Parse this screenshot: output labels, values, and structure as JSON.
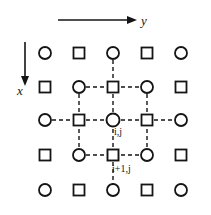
{
  "figure": {
    "width": 211,
    "height": 215,
    "background": "#ffffff",
    "stroke_color": "#151515",
    "marker_fill": "#ffffff"
  },
  "axes": {
    "horizontal": {
      "label": "y",
      "direction": "right",
      "arrow_start_x": 58,
      "arrow_end_x": 132,
      "arrow_y": 20
    },
    "vertical": {
      "label": "x",
      "direction": "down",
      "arrow_x": 25,
      "arrow_start_y": 42,
      "arrow_end_y": 82
    }
  },
  "grid": {
    "columns_x": [
      45,
      79,
      113,
      147,
      181
    ],
    "rows_y": [
      53,
      87,
      120,
      155,
      190
    ],
    "marker_types": [
      [
        "circle",
        "square",
        "circle",
        "square",
        "circle"
      ],
      [
        "square",
        "circle",
        "square",
        "circle",
        "square"
      ],
      [
        "circle",
        "square",
        "circle",
        "square",
        "circle"
      ],
      [
        "square",
        "circle",
        "square",
        "circle",
        "square"
      ],
      [
        "circle",
        "square",
        "circle",
        "square",
        "circle"
      ]
    ],
    "circle_radius": 6,
    "square_size": 11,
    "line_style": "dashed",
    "dash_pattern": "4,3"
  },
  "labels": {
    "center_node": "i,j",
    "below_node": "i+1,j"
  },
  "stencil": {
    "center_row": 2,
    "center_col": 2,
    "description": "dashed connections form 3x3 stencil around center node with stubs extending outward"
  }
}
